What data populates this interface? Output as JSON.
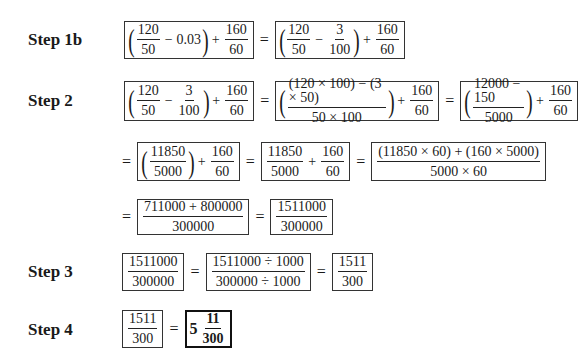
{
  "steps": [
    {
      "label": "Step 1b"
    },
    {
      "label": "Step 2"
    },
    {
      "label": "Step 3"
    },
    {
      "label": "Step 4"
    }
  ],
  "symbols": {
    "eq": "=",
    "plus": "+",
    "minus": "−",
    "lparen": "(",
    "rparen": ")"
  },
  "step1b": {
    "box1": {
      "f1_num": "120",
      "f1_den": "50",
      "sub": "0.03",
      "f2_num": "160",
      "f2_den": "60"
    },
    "box2": {
      "f1_num": "120",
      "f1_den": "50",
      "f2_num": "3",
      "f2_den": "100",
      "f3_num": "160",
      "f3_den": "60"
    }
  },
  "step2": {
    "r1": {
      "box1": {
        "f1_num": "120",
        "f1_den": "50",
        "f2_num": "3",
        "f2_den": "100",
        "f3_num": "160",
        "f3_den": "60"
      },
      "box2": {
        "f1_num": "(120 × 100) − (3 × 50)",
        "f1_den": "50 × 100",
        "f2_num": "160",
        "f2_den": "60"
      },
      "box3": {
        "f1_num": "12000 − 150",
        "f1_den": "5000",
        "f2_num": "160",
        "f2_den": "60"
      }
    },
    "r2": {
      "box1": {
        "f1_num": "11850",
        "f1_den": "5000",
        "f2_num": "160",
        "f2_den": "60"
      },
      "box2": {
        "f1_num": "11850",
        "f1_den": "5000",
        "f2_num": "160",
        "f2_den": "60"
      },
      "box3": {
        "f1_num": "(11850 × 60) + (160 × 5000)",
        "f1_den": "5000 × 60"
      }
    },
    "r3": {
      "box1": {
        "f1_num": "711000 + 800000",
        "f1_den": "300000"
      },
      "box2": {
        "f1_num": "1511000",
        "f1_den": "300000"
      }
    }
  },
  "step3": {
    "box1": {
      "f1_num": "1511000",
      "f1_den": "300000"
    },
    "box2": {
      "f1_num": "1511000 ÷ 1000",
      "f1_den": "300000 ÷ 1000"
    },
    "box3": {
      "f1_num": "1511",
      "f1_den": "300"
    }
  },
  "step4": {
    "box1": {
      "f1_num": "1511",
      "f1_den": "300"
    },
    "box2": {
      "whole": "5",
      "f1_num": "11",
      "f1_den": "300"
    }
  }
}
